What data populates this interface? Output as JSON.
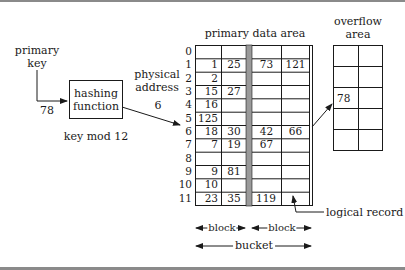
{
  "labels": {
    "primary_key_line1": "primary",
    "primary_key_line2": "key",
    "key_value": "78",
    "hash_line1": "hashing",
    "hash_line2": "function",
    "hash_formula": "key mod 12",
    "physical_line1": "physical",
    "physical_line2": "address",
    "physical_value": "6",
    "primary_data_area": "primary data area",
    "overflow_line1": "overflow",
    "overflow_line2": "area",
    "logical_record": "logical record",
    "block1": "block",
    "block2": "block",
    "bucket": "bucket"
  },
  "primary_data_area": {
    "row_labels": [
      "0",
      "1",
      "2",
      "3",
      "4",
      "5",
      "6",
      "7",
      "8",
      "9",
      "10",
      "11"
    ],
    "rows": [
      [
        "",
        "",
        "",
        ""
      ],
      [
        "1",
        "25",
        "73",
        "121"
      ],
      [
        "2",
        "",
        "",
        ""
      ],
      [
        "15",
        "27",
        "",
        ""
      ],
      [
        "16",
        "",
        "",
        ""
      ],
      [
        "125",
        "",
        "",
        ""
      ],
      [
        "18",
        "30",
        "42",
        "66"
      ],
      [
        "7",
        "19",
        "67",
        ""
      ],
      [
        "",
        "",
        "",
        ""
      ],
      [
        "9",
        "81",
        "",
        ""
      ],
      [
        "10",
        "",
        "",
        ""
      ],
      [
        "23",
        "35",
        "119",
        ""
      ]
    ]
  },
  "overflow_area": {
    "rows": [
      [
        "",
        ""
      ],
      [
        "",
        ""
      ],
      [
        "78",
        ""
      ],
      [
        "",
        ""
      ],
      [
        "",
        ""
      ]
    ]
  },
  "colors": {
    "line": "#1a1a1a",
    "block_separator": "#9a9a9a",
    "frame": "#8a8a8a"
  }
}
